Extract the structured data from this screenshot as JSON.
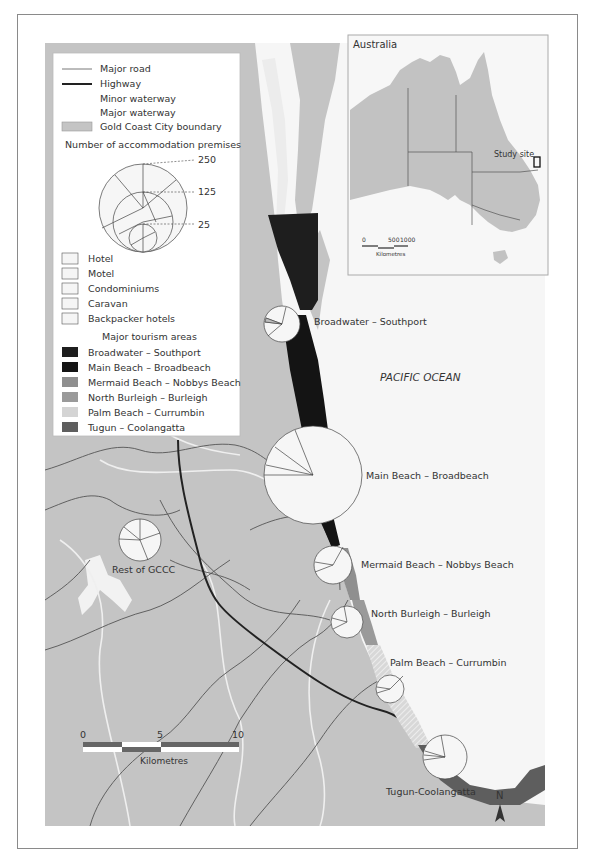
{
  "legend": {
    "lines": [
      {
        "label": "Major road",
        "style": "thin"
      },
      {
        "label": "Highway",
        "style": "thick"
      },
      {
        "label": "Minor waterway",
        "style": "white-thin"
      },
      {
        "label": "Major waterway",
        "style": "white-thick"
      },
      {
        "label": "Gold Coast City boundary",
        "style": "box"
      }
    ],
    "size_title": "Number of accommodation premises",
    "size_values": [
      "250",
      "125",
      "25"
    ],
    "categories_title": "",
    "categories": [
      {
        "label": "Hotel"
      },
      {
        "label": "Motel"
      },
      {
        "label": "Condominiums"
      },
      {
        "label": "Caravan"
      },
      {
        "label": "Backpacker hotels"
      }
    ],
    "areas_title": "Major tourism areas",
    "areas": [
      {
        "label": "Broadwater – Southport",
        "color": "#1e1e1e"
      },
      {
        "label": "Main Beach – Broadbeach",
        "color": "#141414"
      },
      {
        "label": "Mermaid Beach – Nobbys Beach",
        "color": "#8f8f8f"
      },
      {
        "label": "North Burleigh – Burleigh",
        "color": "#9a9a9a"
      },
      {
        "label": "Palm Beach – Currumbin",
        "color": "#d4d4d4"
      },
      {
        "label": "Tugun – Coolangatta",
        "color": "#5e5e5e"
      }
    ]
  },
  "inset": {
    "title": "Australia",
    "study_site_label": "Study site",
    "scale": {
      "ticks": [
        "0",
        "500",
        "1000"
      ],
      "unit": "Kilometres"
    }
  },
  "map": {
    "ocean_label": "PACIFIC OCEAN",
    "scale": {
      "ticks": [
        "0",
        "5",
        "10"
      ],
      "unit": "Kilometres"
    },
    "north_label": "N",
    "colors": {
      "land": "#c4c4c4",
      "water": "#f5f5f5",
      "road": "#555555",
      "highway": "#222222"
    },
    "pies": [
      {
        "label": "Broadwater – Southport",
        "premises_approx": 60
      },
      {
        "label": "Main Beach – Broadbeach",
        "premises_approx": 250
      },
      {
        "label": "Mermaid Beach – Nobbys Beach",
        "premises_approx": 35
      },
      {
        "label": "North Burleigh – Burleigh",
        "premises_approx": 30
      },
      {
        "label": "Palm Beach – Currumbin",
        "premises_approx": 22
      },
      {
        "label": "Tugun-Coolangatta",
        "premises_approx": 55
      },
      {
        "label": "Rest of GCCC",
        "premises_approx": 45
      }
    ]
  }
}
